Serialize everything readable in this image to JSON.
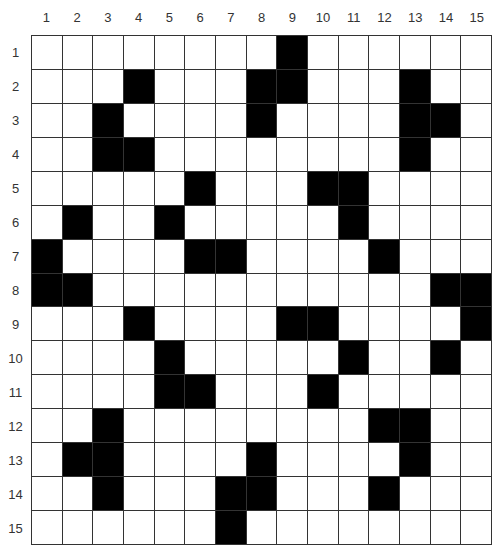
{
  "puzzle": {
    "rows": 15,
    "cols": 15,
    "column_labels": [
      "1",
      "2",
      "3",
      "4",
      "5",
      "6",
      "7",
      "8",
      "9",
      "10",
      "11",
      "12",
      "13",
      "14",
      "15"
    ],
    "row_labels": [
      "1",
      "2",
      "3",
      "4",
      "5",
      "6",
      "7",
      "8",
      "9",
      "10",
      "11",
      "12",
      "13",
      "14",
      "15"
    ],
    "colors": {
      "black_cell": "#000000",
      "white_cell": "#ffffff",
      "grid_line": "#333333"
    },
    "black_cells": {
      "1": [
        9
      ],
      "2": [
        4,
        8,
        9,
        13
      ],
      "3": [
        3,
        8,
        13,
        14
      ],
      "4": [
        3,
        4,
        13
      ],
      "5": [
        6,
        10,
        11
      ],
      "6": [
        2,
        5,
        11
      ],
      "7": [
        1,
        6,
        7,
        12
      ],
      "8": [
        1,
        2,
        14,
        15
      ],
      "9": [
        4,
        9,
        10,
        15
      ],
      "10": [
        5,
        11,
        14
      ],
      "11": [
        5,
        6,
        10
      ],
      "12": [
        3,
        12,
        13
      ],
      "13": [
        2,
        3,
        8,
        13
      ],
      "14": [
        3,
        7,
        8,
        12
      ],
      "15": [
        7
      ]
    }
  }
}
